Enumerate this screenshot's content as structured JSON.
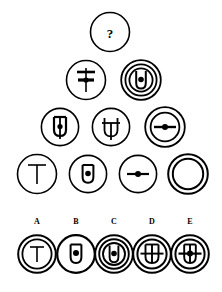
{
  "puzzle": {
    "type": "visual-analogy-matrix",
    "title": "",
    "unknown_marker": "?",
    "stroke_color": "#000000",
    "fill_color": "#ffffff",
    "background": "#ffffff"
  },
  "matrix": {
    "rows": [
      {
        "row_index": 1,
        "cells": [
          {
            "id": "r1c1",
            "label": "?",
            "outer_rings": 1,
            "inner_glyph": "question-mark",
            "has_center_dot": false,
            "cx": 110,
            "cy": 32,
            "r": 21
          }
        ]
      },
      {
        "row_index": 2,
        "cells": [
          {
            "id": "r2c1",
            "label": "cross-with-bar",
            "outer_rings": 1,
            "inner_glyph": "cross-bar-vertical",
            "has_center_dot": true,
            "cx": 86,
            "cy": 80,
            "r": 21
          },
          {
            "id": "r2c2",
            "label": "u-dot-triple-ring",
            "outer_rings": 3,
            "inner_glyph": "u-shape",
            "has_center_dot": true,
            "cx": 141,
            "cy": 80,
            "r": 21
          }
        ]
      },
      {
        "row_index": 3,
        "cells": [
          {
            "id": "r3c1",
            "label": "u-stem-dot",
            "outer_rings": 1,
            "inner_glyph": "u-shape-stem",
            "has_center_dot": true,
            "cx": 60,
            "cy": 127,
            "r": 20
          },
          {
            "id": "r3c2",
            "label": "u-crossbar",
            "outer_rings": 1,
            "inner_glyph": "u-crossbar",
            "has_center_dot": false,
            "cx": 111,
            "cy": 127,
            "r": 20
          },
          {
            "id": "r3c3",
            "label": "double-ring-hline-dot",
            "outer_rings": 2,
            "inner_glyph": "horizontal-line",
            "has_center_dot": true,
            "cx": 165,
            "cy": 127,
            "r": 21
          }
        ]
      },
      {
        "row_index": 4,
        "cells": [
          {
            "id": "r4c1",
            "label": "tee",
            "outer_rings": 1,
            "inner_glyph": "tee-shape",
            "has_center_dot": false,
            "cx": 37,
            "cy": 174,
            "r": 21
          },
          {
            "id": "r4c2",
            "label": "u-dot",
            "outer_rings": 1,
            "inner_glyph": "u-shape",
            "has_center_dot": true,
            "cx": 88,
            "cy": 174,
            "r": 20
          },
          {
            "id": "r4c3",
            "label": "hline-dot",
            "outer_rings": 1,
            "inner_glyph": "horizontal-line",
            "has_center_dot": true,
            "cx": 138,
            "cy": 174,
            "r": 20
          },
          {
            "id": "r4c4",
            "label": "double-ring-empty",
            "outer_rings": 2,
            "inner_glyph": "none",
            "has_center_dot": false,
            "cx": 188,
            "cy": 174,
            "r": 21
          }
        ]
      }
    ]
  },
  "options": {
    "heading": "",
    "items": [
      {
        "letter": "A",
        "id": "option-a",
        "label": "tee-double-ring",
        "outer_rings": 2,
        "inner_glyph": "tee-shape",
        "has_center_dot": false,
        "cx": 37,
        "cy": 254,
        "r": 20,
        "label_x": 30,
        "label_y": 219
      },
      {
        "letter": "B",
        "id": "option-b",
        "label": "u-dot-single-ring",
        "outer_rings": 1,
        "inner_glyph": "u-shape",
        "has_center_dot": true,
        "cx": 76,
        "cy": 254,
        "r": 20,
        "label_x": 69,
        "label_y": 219
      },
      {
        "letter": "C",
        "id": "option-c",
        "label": "u-dot-triple-ring",
        "outer_rings": 3,
        "inner_glyph": "u-shape",
        "has_center_dot": true,
        "cx": 114,
        "cy": 254,
        "r": 20,
        "label_x": 107,
        "label_y": 219
      },
      {
        "letter": "D",
        "id": "option-d",
        "label": "grid-double-ring",
        "outer_rings": 2,
        "inner_glyph": "grid-shape",
        "has_center_dot": false,
        "cx": 152,
        "cy": 254,
        "r": 20,
        "label_x": 145,
        "label_y": 219
      },
      {
        "letter": "E",
        "id": "option-e",
        "label": "grid-dot-double-ring",
        "outer_rings": 2,
        "inner_glyph": "grid-shape",
        "has_center_dot": true,
        "cx": 190,
        "cy": 254,
        "r": 20,
        "label_x": 183,
        "label_y": 219
      }
    ]
  }
}
